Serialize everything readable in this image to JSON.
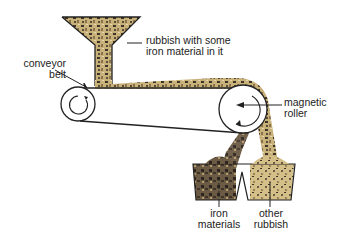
{
  "diagram": {
    "type": "process-diagram",
    "colors": {
      "line": "#222222",
      "rubbish_light": "#c9b27a",
      "rubbish_mid": "#8a7450",
      "rubbish_dark": "#3e3428",
      "iron_dark": "#4a3c2e",
      "background": "#ffffff"
    },
    "labels": {
      "hopper": {
        "line1": "rubbish with some",
        "line2": "iron material in it"
      },
      "conveyor": {
        "line1": "conveyor",
        "line2": "belt"
      },
      "roller": {
        "line1": "magnetic",
        "line2": "roller"
      },
      "iron_bin": {
        "line1": "iron",
        "line2": "materials"
      },
      "other_bin": {
        "line1": "other",
        "line2": "rubbish"
      }
    },
    "components": [
      "hopper",
      "conveyor belt",
      "drive roller",
      "magnetic roller",
      "iron materials bin",
      "other rubbish bin"
    ]
  }
}
